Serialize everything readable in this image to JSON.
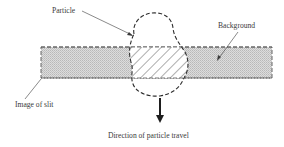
{
  "diagram": {
    "type": "schematic",
    "labels": {
      "particle": "Particle",
      "background": "Background",
      "image_of_slit": "Image of slit",
      "direction": "Direction of particle travel"
    },
    "elements": {
      "slit": {
        "shape": "rectangle",
        "style": "dashed outline, stippled gray fill",
        "fill_color": "#d4d4d4"
      },
      "particle": {
        "shape": "irregular blob",
        "style": "dashed outline",
        "overlap_style": "diagonal hatching"
      },
      "arrow": {
        "direction": "down",
        "style": "solid bold"
      }
    },
    "colors": {
      "line": "#3a3a3a",
      "fill": "#d4d4d4",
      "background": "#ffffff"
    }
  }
}
